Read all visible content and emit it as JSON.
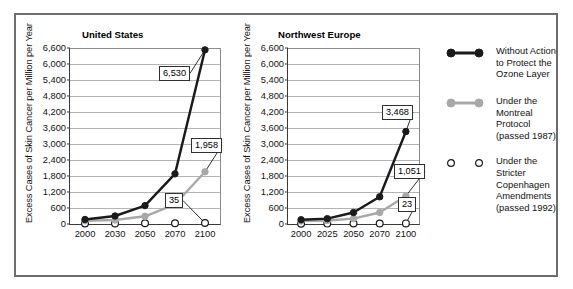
{
  "chart_data": {
    "type": "line",
    "title": "",
    "ylabel": "Excess Cases of Skin Cancer per Million per Year",
    "ylim": [
      0,
      6600
    ],
    "ytick_step": 600,
    "yticks": [
      "0",
      "600",
      "1,200",
      "1,800",
      "2,400",
      "3,000",
      "3,600",
      "4,200",
      "4,800",
      "5,400",
      "6,000",
      "6,600"
    ],
    "grid": true,
    "legend_position": "right",
    "panels": [
      {
        "title": "United States",
        "xlabel": "",
        "categories": [
          "2000",
          "2030",
          "2050",
          "2070",
          "2100"
        ],
        "series": [
          {
            "name": "Without Action to Protect the Ozone Layer",
            "color": "#1a1a1a",
            "marker": "filled-circle",
            "values": [
              170,
              300,
              690,
              1880,
              6530
            ],
            "label_value": "6,530",
            "label_index": 4
          },
          {
            "name": "Under the Montreal Protocol (passed 1987)",
            "color": "#a8a8a8",
            "marker": "filled-circle",
            "values": [
              120,
              150,
              290,
              740,
              1958
            ],
            "label_value": "1,958",
            "label_index": 4
          },
          {
            "name": "Under the Stricter Copenhagen Amendments (passed 1992)",
            "color": "#ffffff",
            "marker": "open-circle",
            "values": [
              18,
              22,
              26,
              30,
              35
            ],
            "label_value": "35",
            "label_index": 4
          }
        ]
      },
      {
        "title": "Northwest Europe",
        "xlabel": "",
        "categories": [
          "2000",
          "2025",
          "2050",
          "2070",
          "2100"
        ],
        "series": [
          {
            "name": "Without Action to Protect the Ozone Layer",
            "color": "#1a1a1a",
            "marker": "filled-circle",
            "values": [
              160,
              200,
              430,
              1020,
              3468
            ],
            "label_value": "3,468",
            "label_index": 4
          },
          {
            "name": "Under the Montreal Protocol (passed 1987)",
            "color": "#a8a8a8",
            "marker": "filled-circle",
            "values": [
              110,
              130,
              200,
              430,
              1051
            ],
            "label_value": "1,051",
            "label_index": 4
          },
          {
            "name": "Under the Stricter Copenhagen Amendments (passed 1992)",
            "color": "#ffffff",
            "marker": "open-circle",
            "values": [
              12,
              15,
              18,
              20,
              23
            ],
            "label_value": "23",
            "label_index": 4
          }
        ]
      }
    ],
    "legend": [
      {
        "label": "Without Action\nto Protect the\nOzone Layer",
        "style": "black-filled"
      },
      {
        "label": "Under the\nMontreal Protocol\n(passed 1987)",
        "style": "gray-filled"
      },
      {
        "label": "Under the Stricter\nCopenhagen\nAmendments\n(passed 1992)",
        "style": "open"
      }
    ]
  },
  "colors": {
    "black_series": "#1a1a1a",
    "gray_series": "#a8a8a8",
    "open_series": "#ffffff",
    "grid": "#b4b4b4",
    "frame": "#6d6d6d"
  }
}
